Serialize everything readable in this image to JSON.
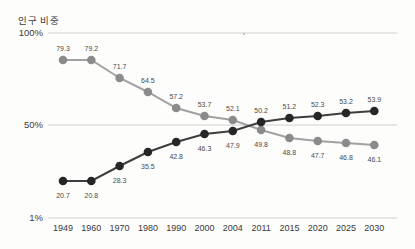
{
  "title": "인구 비중",
  "chart_data": {
    "type": "line",
    "title": "인구 비중",
    "categories": [
      "1949",
      "1960",
      "1970",
      "1980",
      "1990",
      "2000",
      "2004",
      "2011",
      "2015",
      "2020",
      "2025",
      "2030"
    ],
    "series": [
      {
        "name": "gray-series",
        "dot_color": "#8b8b8b",
        "line_color": "#a1a1a1",
        "values": [
          79.3,
          79.2,
          71.7,
          64.5,
          57.2,
          53.7,
          52.1,
          49.8,
          48.8,
          47.7,
          46.8,
          46.1
        ]
      },
      {
        "name": "dark-series",
        "dot_color": "#262626",
        "line_color": "#3e3e3e",
        "values": [
          20.7,
          20.8,
          28.3,
          35.5,
          42.8,
          46.3,
          47.9,
          50.2,
          51.2,
          52.3,
          53.2,
          53.9
        ]
      }
    ],
    "y_ticks": [
      {
        "label": "100%",
        "pct": 100
      },
      {
        "label": "50%",
        "pct": 50
      },
      {
        "label": "1%",
        "pct": 1
      }
    ],
    "ylim": [
      1,
      100
    ],
    "grid": "horizontal",
    "legend": "none",
    "label_rule": "labels outside: above dot when value >= 50, below dot when value < 50",
    "layout": {
      "width": 415,
      "height": 249,
      "grid_x": [
        48,
        397
      ],
      "tick_y": [
        33,
        125,
        218
      ],
      "x0": 63,
      "dx": 28.3,
      "dot_r": 4.3,
      "line_w": 2,
      "series_y_px": [
        [
          60,
          60,
          78,
          92,
          108,
          116,
          120,
          130,
          138,
          141,
          143,
          145
        ],
        [
          181,
          181,
          166,
          152,
          142,
          134,
          131,
          122,
          118,
          116,
          113,
          111
        ]
      ],
      "label_above_off": -16,
      "label_below_off": 10,
      "grid_color": "#d0d0d0",
      "stray_mark": {
        "x": 243,
        "y": 33
      }
    }
  }
}
